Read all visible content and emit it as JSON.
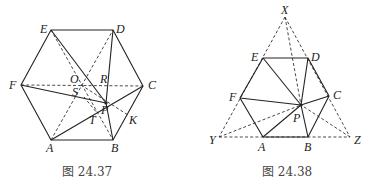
{
  "figures": [
    {
      "caption": "图 24.37",
      "points": {
        "A": [
          51,
          140
        ],
        "B": [
          113,
          140
        ],
        "C": [
          143,
          86
        ],
        "D": [
          113,
          30
        ],
        "E": [
          51,
          30
        ],
        "F": [
          21,
          85
        ],
        "P": [
          106,
          103
        ],
        "O": [
          81,
          85
        ],
        "R": [
          108,
          85
        ],
        "S": [
          84,
          97
        ],
        "T": [
          97,
          113
        ],
        "K": [
          128,
          115
        ]
      },
      "labels": {
        "A": "A",
        "B": "B",
        "C": "C",
        "D": "D",
        "E": "E",
        "F": "F",
        "O": "O",
        "R": "R",
        "S": "S",
        "P": "P",
        "T": "T",
        "K": "K"
      }
    },
    {
      "caption": "图 24.38",
      "points": {
        "X": [
          285,
          17
        ],
        "Y": [
          219,
          137
        ],
        "Z": [
          350,
          137
        ],
        "A": [
          263,
          137
        ],
        "B": [
          308,
          137
        ],
        "C": [
          329,
          96
        ],
        "D": [
          308,
          58
        ],
        "E": [
          263,
          58
        ],
        "F": [
          240,
          98
        ],
        "P": [
          301,
          105
        ]
      },
      "labels": {
        "X": "X",
        "Y": "Y",
        "Z": "Z",
        "A": "A",
        "B": "B",
        "C": "C",
        "D": "D",
        "E": "E",
        "F": "F",
        "P": "P"
      }
    }
  ]
}
